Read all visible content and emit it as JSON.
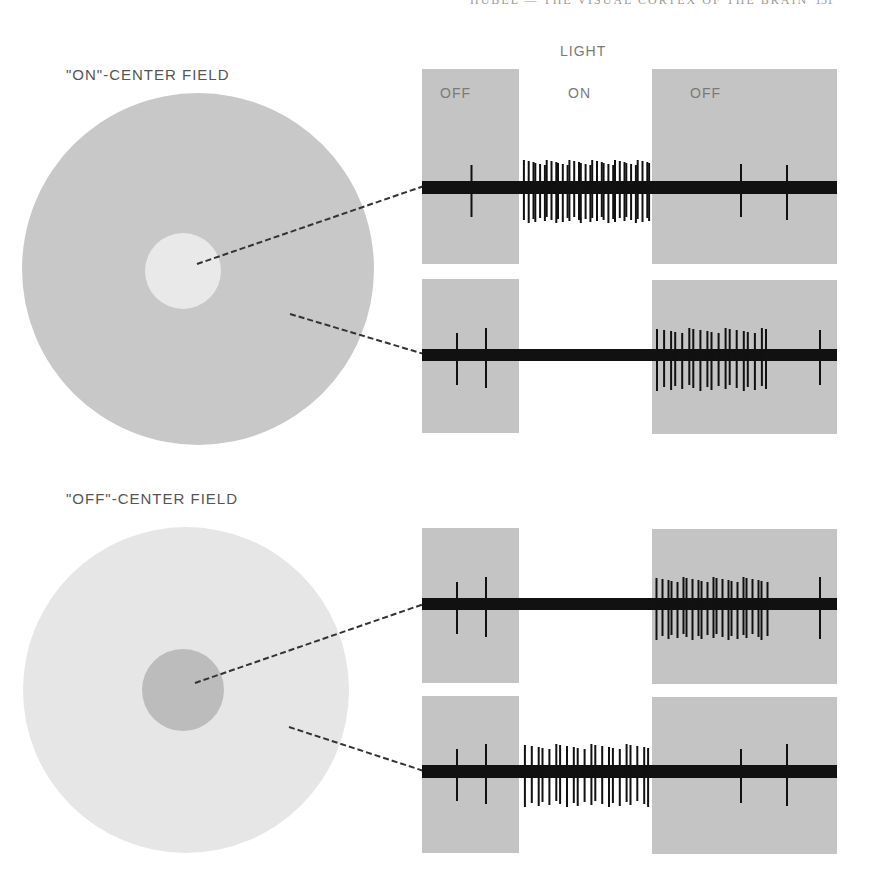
{
  "header": {
    "running_head": "HUBEL — THE VISUAL CORTEX OF THE BRAIN",
    "page_number": "151"
  },
  "stimulus_labels": {
    "light": "LIGHT",
    "off_left": "OFF",
    "on": "ON",
    "off_right": "OFF"
  },
  "fields": [
    {
      "label": "\"ON\"-CENTER FIELD",
      "surround_color": "#c8c8c8",
      "center_color": "#e9e9e9",
      "recordings": [
        {
          "stimulated_region": "center",
          "response": "fires during light ON",
          "spikes_off_before": 1,
          "spikes_on": 34,
          "spikes_off_after": 2
        },
        {
          "stimulated_region": "surround",
          "response": "fires after light turns OFF",
          "spikes_off_before": 2,
          "spikes_on": 0,
          "spikes_off_after": 20
        }
      ]
    },
    {
      "label": "\"OFF\"-CENTER FIELD",
      "surround_color": "#e6e6e6",
      "center_color": "#bcbcbc",
      "recordings": [
        {
          "stimulated_region": "center",
          "response": "fires after light turns OFF",
          "spikes_off_before": 2,
          "spikes_on": 0,
          "spikes_off_after": 24
        },
        {
          "stimulated_region": "surround",
          "response": "fires during light ON",
          "spikes_off_before": 2,
          "spikes_on": 22,
          "spikes_off_after": 2
        }
      ]
    }
  ],
  "colors": {
    "panel_gray": "#c4c4c4",
    "trace": "#111111",
    "label_text": "#555555"
  }
}
